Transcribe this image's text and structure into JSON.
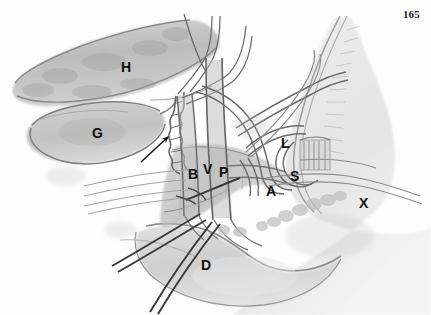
{
  "page": {
    "folio": "165",
    "background_color": "#fdfdfd",
    "width": 431,
    "height": 315
  },
  "figure": {
    "kind": "anatomical-line-and-wash-illustration",
    "ink_color": "#5a5a5a",
    "wash_color": "#b9b9b9",
    "dark_instrument_color": "#3c3c3c",
    "labels": [
      {
        "id": "H",
        "text": "H",
        "x": 121,
        "y": 60
      },
      {
        "id": "G",
        "text": "G",
        "x": 92,
        "y": 126
      },
      {
        "id": "B",
        "text": "B",
        "x": 188,
        "y": 167
      },
      {
        "id": "V",
        "text": "V",
        "x": 203,
        "y": 162
      },
      {
        "id": "P",
        "text": "P",
        "x": 219,
        "y": 165
      },
      {
        "id": "L",
        "text": "L",
        "x": 281,
        "y": 136
      },
      {
        "id": "S",
        "text": "S",
        "x": 290,
        "y": 169
      },
      {
        "id": "A",
        "text": "A",
        "x": 266,
        "y": 184
      },
      {
        "id": "X",
        "text": "X",
        "x": 359,
        "y": 196
      },
      {
        "id": "D",
        "text": "D",
        "x": 201,
        "y": 258
      }
    ],
    "pointer": {
      "name": "leader-arrow",
      "from_x": 141,
      "from_y": 162,
      "to_x": 169,
      "to_y": 137
    }
  }
}
